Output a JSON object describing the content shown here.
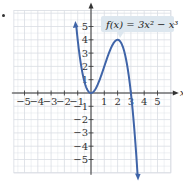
{
  "chart_data": {
    "type": "line",
    "title": "",
    "annotation": "f(x) = 3x² − x³",
    "function": "3x^2 - x^3",
    "xlabel": "x",
    "ylabel": "y",
    "xlim": [
      -5.8,
      6
    ],
    "ylim": [
      -6,
      6.2
    ],
    "grid": true,
    "x_ticks": [
      -5,
      -4,
      -3,
      -2,
      -1,
      1,
      2,
      3,
      4,
      5
    ],
    "x_tick_labels": [
      "−5",
      "−4",
      "−3",
      "−2",
      "−1",
      "1",
      "2",
      "3",
      "4",
      "5"
    ],
    "y_ticks": [
      -5,
      -4,
      -3,
      -2,
      -1,
      1,
      2,
      3,
      4,
      5
    ],
    "y_tick_labels": [
      "−5",
      "−4",
      "−3",
      "−2",
      "−1",
      "1",
      "2",
      "3",
      "4",
      "5"
    ],
    "series": [
      {
        "name": "f(x) = 3x^2 - x^3",
        "color": "#3f64a8",
        "x": [
          -1.1,
          -1,
          -0.5,
          0,
          0.5,
          1,
          1.5,
          2,
          2.5,
          3,
          3.3,
          3.5
        ],
        "y": [
          4.96,
          4,
          0.875,
          0,
          0.625,
          2,
          3.375,
          4,
          3.125,
          0,
          -3.27,
          -6.125
        ]
      }
    ],
    "colors": {
      "curve": "#3f64a8",
      "grid": "#d9dde3",
      "axis": "#333333",
      "label_box": "#dde7ef"
    }
  }
}
